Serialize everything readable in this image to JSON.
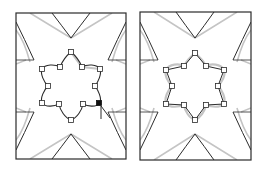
{
  "figure": {
    "colors": {
      "stroke": "#2b2b2b",
      "ghost_stroke": "#c4c4c4",
      "anchor_fill": "#ffffff",
      "selected_anchor_fill": "#111111",
      "background": "#ffffff"
    },
    "panels": [
      {
        "id": "left",
        "path_style": "curved",
        "anchor_count": 12,
        "selected_anchor_index": 3,
        "has_cursor": true
      },
      {
        "id": "right",
        "path_style": "straight",
        "anchor_count": 12,
        "selected_anchor_index": null,
        "has_cursor": false
      }
    ],
    "icons": {
      "cursor": "arrow-cursor-icon",
      "anchor": "square-anchor-icon"
    }
  }
}
